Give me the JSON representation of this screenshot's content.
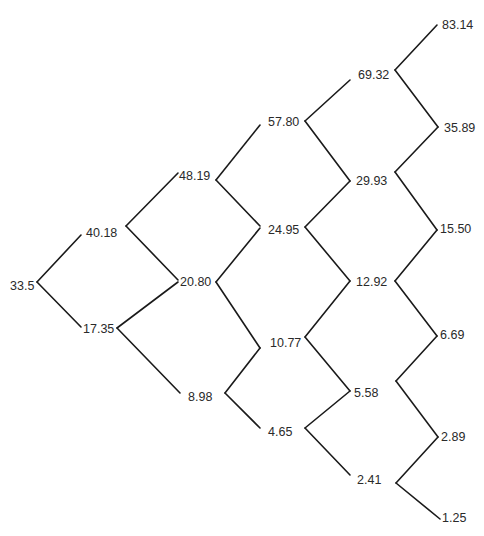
{
  "diagram": {
    "type": "binomial-tree",
    "title": "",
    "root_value": "33.5",
    "steps": 5,
    "nodes": [
      {
        "id": "n0_0",
        "label": "33.5",
        "x": 10,
        "y": 290,
        "vx": 37,
        "vy": 282
      },
      {
        "id": "n1_1",
        "label": "40.18",
        "x": 86,
        "y": 237,
        "vx": 126,
        "vy": 226
      },
      {
        "id": "n1_0",
        "label": "17.35",
        "x": 83,
        "y": 333,
        "vx": 117,
        "vy": 328
      },
      {
        "id": "n2_2",
        "label": "48.19",
        "x": 179,
        "y": 180,
        "vx": 216,
        "vy": 180
      },
      {
        "id": "n2_1",
        "label": "20.80",
        "x": 180,
        "y": 286,
        "vx": 216,
        "vy": 282
      },
      {
        "id": "n2_0",
        "label": "8.98",
        "x": 188,
        "y": 401,
        "vx": 225,
        "vy": 393
      },
      {
        "id": "n3_3",
        "label": "57.80",
        "x": 268,
        "y": 126,
        "vx": 305,
        "vy": 121
      },
      {
        "id": "n3_2",
        "label": "24.95",
        "x": 268,
        "y": 234,
        "vx": 305,
        "vy": 227
      },
      {
        "id": "n3_1",
        "label": "10.77",
        "x": 270,
        "y": 347,
        "vx": 305,
        "vy": 337
      },
      {
        "id": "n3_0",
        "label": "4.65",
        "x": 268,
        "y": 436,
        "vx": 305,
        "vy": 428
      },
      {
        "id": "n4_4",
        "label": "69.32",
        "x": 358,
        "y": 79,
        "vx": 395,
        "vy": 70
      },
      {
        "id": "n4_3",
        "label": "29.93",
        "x": 356,
        "y": 185,
        "vx": 395,
        "vy": 172
      },
      {
        "id": "n4_2",
        "label": "12.92",
        "x": 356,
        "y": 286,
        "vx": 395,
        "vy": 281
      },
      {
        "id": "n4_1",
        "label": "5.58",
        "x": 354,
        "y": 397,
        "vx": 396,
        "vy": 381
      },
      {
        "id": "n4_0",
        "label": "2.41",
        "x": 357,
        "y": 484,
        "vx": 396,
        "vy": 483
      },
      {
        "id": "n5_5",
        "label": "83.14",
        "x": 442,
        "y": 29
      },
      {
        "id": "n5_4",
        "label": "35.89",
        "x": 444,
        "y": 132
      },
      {
        "id": "n5_3",
        "label": "15.50",
        "x": 440,
        "y": 233
      },
      {
        "id": "n5_2",
        "label": "6.69",
        "x": 440,
        "y": 339
      },
      {
        "id": "n5_1",
        "label": "2.89",
        "x": 441,
        "y": 441
      },
      {
        "id": "n5_0",
        "label": "1.25",
        "x": 442,
        "y": 522
      }
    ],
    "edges": [
      {
        "from": "n0_0",
        "to": "n1_1",
        "x1": 37,
        "y1": 282,
        "x2": 81,
        "y2": 235
      },
      {
        "from": "n0_0",
        "to": "n1_0",
        "x1": 37,
        "y1": 282,
        "x2": 81,
        "y2": 327
      },
      {
        "from": "n1_1",
        "to": "n2_2",
        "x1": 126,
        "y1": 226,
        "x2": 178,
        "y2": 173
      },
      {
        "from": "n1_1",
        "to": "n2_1",
        "x1": 126,
        "y1": 226,
        "x2": 178,
        "y2": 280
      },
      {
        "from": "n1_0",
        "to": "n2_1",
        "x1": 117,
        "y1": 328,
        "x2": 178,
        "y2": 282
      },
      {
        "from": "n1_0",
        "to": "n2_0",
        "x1": 117,
        "y1": 328,
        "x2": 180,
        "y2": 393
      },
      {
        "from": "n2_2",
        "to": "n3_3",
        "x1": 216,
        "y1": 180,
        "x2": 260,
        "y2": 125
      },
      {
        "from": "n2_2",
        "to": "n3_2",
        "x1": 216,
        "y1": 180,
        "x2": 260,
        "y2": 226
      },
      {
        "from": "n2_1",
        "to": "n3_2",
        "x1": 216,
        "y1": 282,
        "x2": 260,
        "y2": 228
      },
      {
        "from": "n2_1",
        "to": "n3_1",
        "x1": 216,
        "y1": 282,
        "x2": 260,
        "y2": 348
      },
      {
        "from": "n2_0",
        "to": "n3_1",
        "x1": 225,
        "y1": 393,
        "x2": 260,
        "y2": 348
      },
      {
        "from": "n2_0",
        "to": "n3_0",
        "x1": 225,
        "y1": 393,
        "x2": 260,
        "y2": 428
      },
      {
        "from": "n3_3",
        "to": "n4_4",
        "x1": 305,
        "y1": 121,
        "x2": 350,
        "y2": 80
      },
      {
        "from": "n3_3",
        "to": "n4_3",
        "x1": 305,
        "y1": 121,
        "x2": 350,
        "y2": 181
      },
      {
        "from": "n3_2",
        "to": "n4_3",
        "x1": 305,
        "y1": 227,
        "x2": 350,
        "y2": 181
      },
      {
        "from": "n3_2",
        "to": "n4_2",
        "x1": 305,
        "y1": 227,
        "x2": 350,
        "y2": 281
      },
      {
        "from": "n3_1",
        "to": "n4_2",
        "x1": 305,
        "y1": 337,
        "x2": 350,
        "y2": 281
      },
      {
        "from": "n3_1",
        "to": "n4_1",
        "x1": 305,
        "y1": 337,
        "x2": 350,
        "y2": 391
      },
      {
        "from": "n3_0",
        "to": "n4_1",
        "x1": 305,
        "y1": 428,
        "x2": 350,
        "y2": 391
      },
      {
        "from": "n3_0",
        "to": "n4_0",
        "x1": 305,
        "y1": 428,
        "x2": 350,
        "y2": 475
      },
      {
        "from": "n4_4",
        "to": "n5_5",
        "x1": 395,
        "y1": 70,
        "x2": 437,
        "y2": 25
      },
      {
        "from": "n4_4",
        "to": "n5_4",
        "x1": 395,
        "y1": 70,
        "x2": 438,
        "y2": 127
      },
      {
        "from": "n4_3",
        "to": "n5_4",
        "x1": 395,
        "y1": 172,
        "x2": 438,
        "y2": 127
      },
      {
        "from": "n4_3",
        "to": "n5_3",
        "x1": 395,
        "y1": 172,
        "x2": 437,
        "y2": 230
      },
      {
        "from": "n4_2",
        "to": "n5_3",
        "x1": 395,
        "y1": 281,
        "x2": 437,
        "y2": 230
      },
      {
        "from": "n4_2",
        "to": "n5_2",
        "x1": 395,
        "y1": 281,
        "x2": 437,
        "y2": 336
      },
      {
        "from": "n4_1",
        "to": "n5_2",
        "x1": 396,
        "y1": 381,
        "x2": 437,
        "y2": 336
      },
      {
        "from": "n4_1",
        "to": "n5_1",
        "x1": 396,
        "y1": 381,
        "x2": 438,
        "y2": 437
      },
      {
        "from": "n4_0",
        "to": "n5_1",
        "x1": 396,
        "y1": 483,
        "x2": 438,
        "y2": 437
      },
      {
        "from": "n4_0",
        "to": "n5_0",
        "x1": 396,
        "y1": 483,
        "x2": 440,
        "y2": 519
      }
    ],
    "colors": {
      "line": "#1a1a1a",
      "text": "#2a2a2a",
      "background": "#ffffff"
    }
  }
}
